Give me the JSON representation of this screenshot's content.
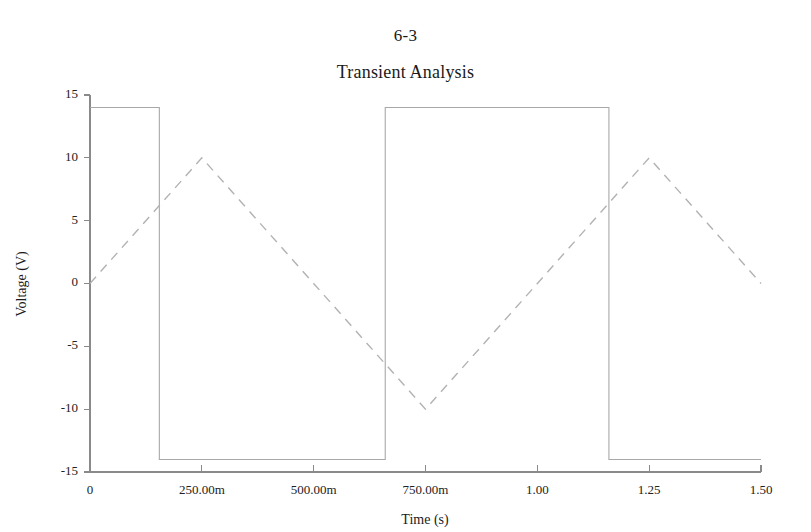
{
  "page": {
    "page_label": "6-3"
  },
  "chart": {
    "title": "Transient Analysis",
    "xlabel": "Time (s)",
    "ylabel": "Voltage (V)"
  },
  "chart_data": {
    "type": "line",
    "title": "Transient Analysis",
    "xlabel": "Time (s)",
    "ylabel": "Voltage (V)",
    "xlim": [
      0,
      1.5
    ],
    "ylim": [
      -15,
      15
    ],
    "grid": false,
    "legend": "none",
    "xticks": [
      0,
      0.25,
      0.5,
      0.75,
      1.0,
      1.25,
      1.5
    ],
    "xtick_labels": [
      "0",
      "250.00m",
      "500.00m",
      "750.00m",
      "1.00",
      "1.25",
      "1.50"
    ],
    "yticks": [
      15,
      10,
      5,
      0,
      -5,
      -10,
      -15
    ],
    "ytick_labels": [
      "15",
      "10",
      "5",
      "0",
      "-5",
      "-10",
      "-15"
    ],
    "series": [
      {
        "name": "square-wave",
        "style": "solid",
        "color": "#a8a8a8",
        "x": [
          0,
          0.155,
          0.155,
          0.66,
          0.66,
          1.16,
          1.16,
          1.5
        ],
        "y": [
          14,
          14,
          -14,
          -14,
          14,
          14,
          -14,
          -14
        ]
      },
      {
        "name": "triangle-wave",
        "style": "dashed",
        "color": "#b2b2b2",
        "x": [
          0,
          0.25,
          0.75,
          1.25,
          1.5
        ],
        "y": [
          0,
          10,
          -10,
          10,
          0
        ]
      }
    ]
  }
}
